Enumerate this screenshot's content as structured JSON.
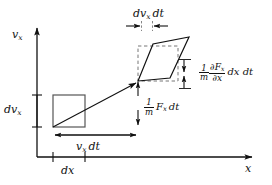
{
  "figure": {
    "background_color": "#ffffff",
    "line_color": "#111111",
    "width": 272,
    "height": 185
  },
  "axes": {
    "y_axis_label": "v",
    "y_axis_label_sub": "x",
    "x_axis_label": "x"
  },
  "labels": {
    "dvx_main": "dv",
    "dvx_sub": "x",
    "dx": "dx",
    "vxdt_main": "v",
    "vxdt_sub": "x",
    "vxdt_tail": "dt",
    "dvxdt_main": "dv",
    "dvxdt_sub": "x",
    "dvxdt_tail": "dt"
  },
  "formulas": {
    "force": {
      "numerator": "1",
      "denominator": "m",
      "body_main": "F",
      "body_sub": "x",
      "tail": "dt"
    },
    "gradient": {
      "numerator": "1",
      "denominator": "m",
      "partial_numerator": "∂F",
      "partial_numerator_sub": "x",
      "partial_denominator": "∂x",
      "tail": "dx dt"
    }
  },
  "shapes": {
    "initial_box": {
      "label": "initial-phase-space-cell"
    },
    "evolved_parallelogram": {
      "label": "evolved-phase-space-cell"
    },
    "dashed_reference_box": {
      "label": "reference-box"
    },
    "flow_arrow": {
      "label": "trajectory-arrow"
    }
  }
}
